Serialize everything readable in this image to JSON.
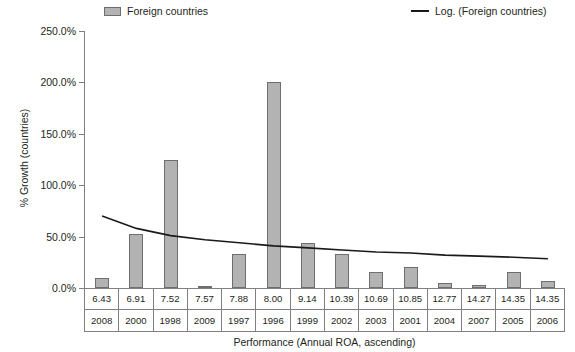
{
  "chart_data": {
    "type": "bar",
    "title": "",
    "xlabel": "Performance (Annual ROA, ascending)",
    "ylabel": "% Growth (countries)",
    "ylim": [
      0,
      250
    ],
    "ytick_labels": [
      "250.0%",
      "200.0%",
      "150.0%",
      "100.0%",
      "50.0%",
      "0.0%"
    ],
    "ytick_values": [
      250,
      200,
      150,
      100,
      50,
      0
    ],
    "grid": false,
    "legend_position": "top",
    "categories": [
      "6.43",
      "6.91",
      "7.52",
      "7.57",
      "7.88",
      "8.00",
      "9.14",
      "10.39",
      "10.69",
      "10.85",
      "12.77",
      "14.27",
      "14.35",
      "14.35"
    ],
    "categories_row2": [
      "2008",
      "2000",
      "1998",
      "2009",
      "1997",
      "1996",
      "1999",
      "2002",
      "2003",
      "2001",
      "2004",
      "2007",
      "2005",
      "2006"
    ],
    "series": [
      {
        "name": "Foreign countries",
        "type": "bar",
        "color": "#b3b3b3",
        "border_color": "#6e6e6e",
        "values": [
          10,
          53,
          125,
          2,
          33,
          200,
          44,
          33,
          16,
          20,
          5,
          3,
          16,
          7
        ]
      },
      {
        "name": "Log. (Foreign countries)",
        "type": "line",
        "color": "#1a1a1a",
        "values": [
          70,
          58,
          51,
          47,
          44,
          41,
          39,
          37,
          35,
          34,
          32,
          31,
          30,
          28.5
        ]
      }
    ]
  },
  "legend": {
    "entries": [
      {
        "label": "Foreign countries",
        "marker": "bar-swatch"
      },
      {
        "label": "Log. (Foreign countries)",
        "marker": "line-swatch"
      }
    ]
  }
}
